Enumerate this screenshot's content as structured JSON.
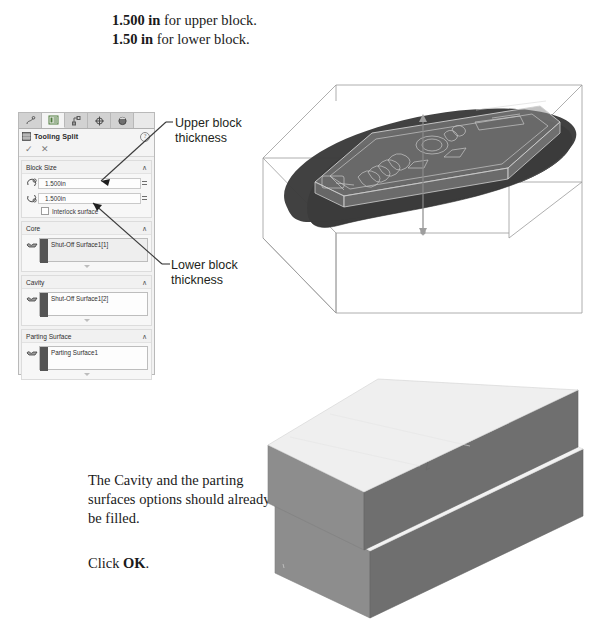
{
  "document": {
    "dimension_note_line1_bold": "1.500 in",
    "dimension_note_line1_rest": " for upper block.",
    "dimension_note_line2_bold": "1.50 in",
    "dimension_note_line2_rest": " for lower block.",
    "cavity_note": "The Cavity and the parting surfaces options should already be filled.",
    "click_prefix": "Click ",
    "click_bold": "OK",
    "click_suffix": "."
  },
  "callouts": {
    "upper_line1": "Upper block",
    "upper_line2": "thickness",
    "lower_line1": "Lower block",
    "lower_line2": "thickness"
  },
  "property_manager": {
    "tabs": [
      {
        "name": "feature-manager-tab",
        "icon": "feature-tree-icon"
      },
      {
        "name": "property-manager-tab",
        "icon": "property-list-icon"
      },
      {
        "name": "configuration-manager-tab",
        "icon": "configuration-icon"
      },
      {
        "name": "dimxpert-manager-tab",
        "icon": "dimxpert-target-icon"
      },
      {
        "name": "display-manager-tab",
        "icon": "display-sphere-icon"
      }
    ],
    "title": "Tooling Split",
    "help_glyph": "?",
    "accept_glyph": "✓",
    "cancel_glyph": "✕",
    "groups": [
      {
        "name": "block-size",
        "header": "Block Size",
        "collapse_glyph": "∧",
        "fields": [
          {
            "name": "upper-block-depth",
            "value": "1.500in"
          },
          {
            "name": "lower-block-depth",
            "value": "1.500in"
          }
        ],
        "checkbox_label": "Interlock surface",
        "checkbox_checked": false
      },
      {
        "name": "core",
        "header": "Core",
        "collapse_glyph": "∧",
        "selection": "Shut-Off Surface1[1]",
        "selection_highlighted": true
      },
      {
        "name": "cavity",
        "header": "Cavity",
        "collapse_glyph": "∧",
        "selection": "Shut-Off Surface1[2]",
        "selection_highlighted": false
      },
      {
        "name": "parting-surface",
        "header": "Parting Surface",
        "collapse_glyph": "∧",
        "selection": "Parting Surface1",
        "selection_highlighted": false
      }
    ]
  },
  "figures": {
    "top_figure_name": "tooling-split-preview-wireframe",
    "bottom_figure_name": "split-block-result-render"
  },
  "colors": {
    "page_background": "#ffffff",
    "panel_background": "#f2f2f2",
    "panel_border": "#b9b9b9",
    "text": "#1a1a1a",
    "callout_text": "#231f20",
    "parting_surface_dark": "#3b3b3b",
    "block_top_light": "#efefef",
    "block_side_mid": "#8d8d8d",
    "block_side_dark": "#6f6f6f",
    "wire_outline": "#8c8c8c"
  }
}
